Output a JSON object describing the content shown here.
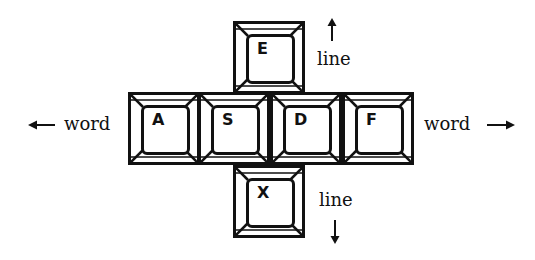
{
  "diagram": {
    "keys": [
      {
        "id": "E",
        "label": "E"
      },
      {
        "id": "A",
        "label": "A"
      },
      {
        "id": "S",
        "label": "S"
      },
      {
        "id": "D",
        "label": "D"
      },
      {
        "id": "F",
        "label": "F"
      },
      {
        "id": "X",
        "label": "X"
      }
    ],
    "annotations": {
      "up": {
        "label": "line",
        "arrow": "up-arrow"
      },
      "down": {
        "label": "line",
        "arrow": "down-arrow"
      },
      "left": {
        "label": "word",
        "arrow": "left-arrow"
      },
      "right": {
        "label": "word",
        "arrow": "right-arrow"
      }
    },
    "colors": {
      "ink": "#111111",
      "background": "#ffffff"
    }
  }
}
